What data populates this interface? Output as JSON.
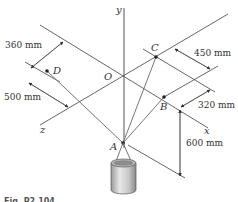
{
  "figure": {
    "caption": "Fig. P2.104",
    "axes": {
      "x": "x",
      "y": "y",
      "z": "z",
      "origin": "O"
    },
    "points": {
      "A": "A",
      "B": "B",
      "C": "C",
      "D": "D"
    },
    "dimensions": {
      "d360": "360 mm",
      "d500": "500 mm",
      "d450": "450 mm",
      "d320": "320 mm",
      "d600": "600 mm"
    },
    "colors": {
      "line": "#444444",
      "cable": "#777777",
      "text": "#333333"
    }
  }
}
